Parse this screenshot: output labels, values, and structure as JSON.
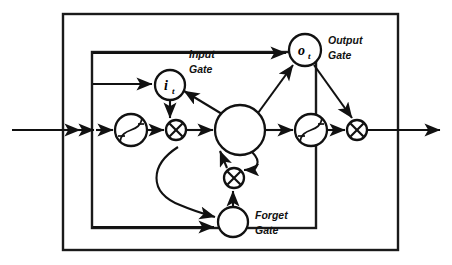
{
  "figure": {
    "type": "diagram",
    "background_color": "#ffffff",
    "line_color": "#111111"
  },
  "labels": {
    "input_gate_line1": "Input",
    "input_gate_line2": "Gate",
    "output_gate_line1": "Output",
    "output_gate_line2": "Gate",
    "forget_gate_line1": "Forget",
    "forget_gate_line2": "Gate"
  },
  "nodes": {
    "input_gate": {
      "symbol": "i",
      "subscript": "t",
      "cx": 170,
      "cy": 85,
      "r": 15
    },
    "output_gate": {
      "symbol": "o",
      "subscript": "t",
      "cx": 305,
      "cy": 50,
      "r": 16
    },
    "forget_gate": {
      "symbol": "",
      "subscript": "",
      "cx": 233,
      "cy": 222,
      "r": 15
    },
    "cell_state": {
      "symbol": "",
      "cx": 240,
      "cy": 130,
      "r": 25
    },
    "input_squash": {
      "symbol": "sigmoid",
      "cx": 131,
      "cy": 130,
      "r": 16
    },
    "output_squash": {
      "symbol": "sigmoid",
      "cx": 311,
      "cy": 130,
      "r": 16
    },
    "input_multiply": {
      "symbol": "×",
      "cx": 176,
      "cy": 130,
      "r": 10
    },
    "recurrent_multiply": {
      "symbol": "×",
      "cx": 234,
      "cy": 178,
      "r": 10
    },
    "output_multiply": {
      "symbol": "×",
      "cx": 357,
      "cy": 130,
      "r": 10
    }
  },
  "frames": {
    "outer": {
      "x": 63,
      "y": 14,
      "width": 335,
      "height": 236
    },
    "inner": {
      "x": 92,
      "y": 52,
      "width": 224,
      "height": 176
    }
  },
  "flow": {
    "input_arrow_label": "cell input",
    "output_arrow_label": "cell output"
  }
}
